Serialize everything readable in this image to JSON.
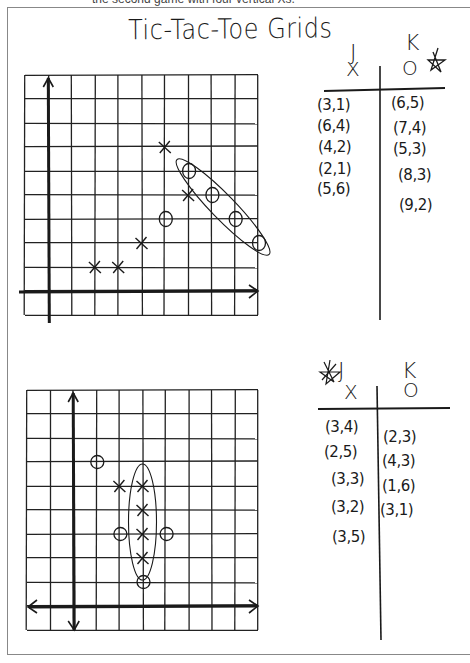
{
  "caption": {
    "text": "the second game with four vertical Xs."
  },
  "title": "Tic-Tac-Toe Grids",
  "games": [
    {
      "id": "game-1",
      "grid": {
        "cols": 10,
        "rows": 10,
        "axis_col": 1,
        "axis_row": 9
      },
      "players": {
        "x_player": {
          "name": "J",
          "symbol": "X"
        },
        "o_player": {
          "name": "K",
          "symbol": "O",
          "mark": "star"
        }
      },
      "x_moves": [
        "(3,1)",
        "(6,4)",
        "(4,2)",
        "(2,1)",
        "(5,6)"
      ],
      "o_moves": [
        "(6,5)",
        "(7,4)",
        "(5,3)",
        "(8,3)",
        "(9,2)"
      ],
      "x_points": [
        [
          3,
          1
        ],
        [
          6,
          4
        ],
        [
          4,
          2
        ],
        [
          2,
          1
        ],
        [
          5,
          6
        ]
      ],
      "o_points": [
        [
          6,
          5
        ],
        [
          7,
          4
        ],
        [
          5,
          3
        ],
        [
          8,
          3
        ],
        [
          9,
          2
        ]
      ],
      "winning_line": {
        "player": "O",
        "points": [
          [
            6,
            5
          ],
          [
            7,
            4
          ],
          [
            8,
            3
          ],
          [
            9,
            2
          ]
        ]
      }
    },
    {
      "id": "game-2",
      "grid": {
        "cols": 10,
        "rows": 10,
        "axis_col": 2,
        "axis_row": 9
      },
      "players": {
        "x_player": {
          "name": "J",
          "symbol": "X",
          "mark": "star-crossed"
        },
        "o_player": {
          "name": "K",
          "symbol": "O"
        }
      },
      "x_moves": [
        "(3,4)",
        "(2,5)",
        "(3,3)",
        "(3,2)",
        "(3,5)"
      ],
      "o_moves": [
        "(2,3)",
        "(4,3)",
        "(1,6)",
        "(3,1)"
      ],
      "x_points": [
        [
          3,
          4
        ],
        [
          2,
          5
        ],
        [
          3,
          3
        ],
        [
          3,
          2
        ],
        [
          3,
          5
        ]
      ],
      "o_points": [
        [
          2,
          3
        ],
        [
          4,
          3
        ],
        [
          1,
          6
        ],
        [
          3,
          1
        ]
      ],
      "winning_line": {
        "player": "X",
        "points": [
          [
            3,
            5
          ],
          [
            3,
            4
          ],
          [
            3,
            3
          ],
          [
            3,
            2
          ]
        ]
      }
    }
  ],
  "colors": {
    "ink": "#1a1a1a",
    "grid": "#222222",
    "frame": "#888888",
    "paper": "#ffffff"
  }
}
